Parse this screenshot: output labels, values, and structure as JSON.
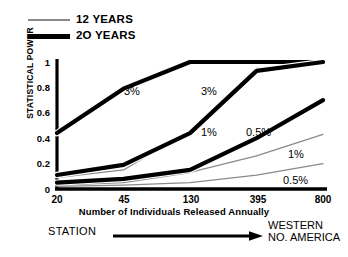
{
  "legend": {
    "items": [
      {
        "label": "12 YEARS",
        "style": "thin",
        "color": "#8a8a8a"
      },
      {
        "label": "2O YEARS",
        "style": "thick",
        "color": "#000000"
      }
    ]
  },
  "axes": {
    "ylabel": "STATISTICAL POWER",
    "yticks": [
      "1",
      "0.8",
      "0.6",
      "0.4",
      "0.2",
      "0"
    ],
    "xticks": [
      "20",
      "45",
      "130",
      "395",
      "800"
    ],
    "xtitle": "Number of Individuals Released Annually"
  },
  "footer": {
    "left": "STATION",
    "arrow": "arrow-right-icon",
    "right_line1": "WESTERN",
    "right_line2": "NO. AMERICA"
  },
  "annotations": [
    {
      "text": "3%",
      "x": 124,
      "y": 85
    },
    {
      "text": "3%",
      "x": 201,
      "y": 85
    },
    {
      "text": "0.5%",
      "x": 246,
      "y": 126
    },
    {
      "text": "1%",
      "x": 201,
      "y": 126
    },
    {
      "text": "1%",
      "x": 288,
      "y": 148
    },
    {
      "text": "0.5%",
      "x": 283,
      "y": 174
    }
  ],
  "chart_data": {
    "type": "line",
    "title": "",
    "xlabel": "Number of Individuals Released Annually",
    "ylabel": "STATISTICAL POWER",
    "categories": [
      "20",
      "45",
      "130",
      "395",
      "800"
    ],
    "ylim": [
      0,
      1
    ],
    "grid": false,
    "legend_position": "top-left",
    "series": [
      {
        "name": "2O YEARS 3%",
        "group": "2O YEARS",
        "detection": "3%",
        "style": "thick",
        "color": "#000000",
        "values": [
          0.44,
          0.79,
          1.0,
          1.0,
          1.0
        ]
      },
      {
        "name": "2O YEARS 1%",
        "group": "2O YEARS",
        "detection": "1%",
        "style": "thick",
        "color": "#000000",
        "values": [
          0.11,
          0.19,
          0.44,
          0.93,
          1.0
        ]
      },
      {
        "name": "2O YEARS 0.5%",
        "group": "2O YEARS",
        "detection": "0.5%",
        "style": "thick",
        "color": "#000000",
        "values": [
          0.05,
          0.08,
          0.15,
          0.4,
          0.7
        ]
      },
      {
        "name": "12 YEARS 3%",
        "group": "12 YEARS",
        "detection": "3%",
        "style": "thin",
        "color": "#8a8a8a",
        "values": [
          0.09,
          0.15,
          0.46,
          0.95,
          1.0
        ]
      },
      {
        "name": "12 YEARS 1%",
        "group": "12 YEARS",
        "detection": "1%",
        "style": "thin",
        "color": "#8a8a8a",
        "values": [
          0.03,
          0.05,
          0.13,
          0.26,
          0.43
        ]
      },
      {
        "name": "12 YEARS 0.5%",
        "group": "12 YEARS",
        "detection": "0.5%",
        "style": "thin",
        "color": "#8a8a8a",
        "values": [
          0.02,
          0.03,
          0.05,
          0.11,
          0.2
        ]
      }
    ]
  }
}
